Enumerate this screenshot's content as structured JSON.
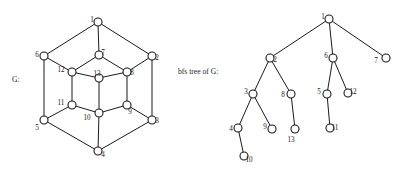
{
  "figure": {
    "width": 408,
    "height": 173,
    "background": "#ffffff",
    "stroke_color": "#1a1a1a",
    "node_fill": "#ffffff"
  },
  "captions": {
    "left_label": "G:",
    "right_label": "bfs tree of G:"
  },
  "chart_data": {
    "type": "diagram",
    "title": "",
    "subtitle": "",
    "panels": [
      {
        "name": "graph-g",
        "label": "G:",
        "label_position": {
          "x": 12,
          "y": 75
        },
        "description": "Undirected graph G drawn as three nested hexagonal rings",
        "nodes": [
          {
            "id": "1",
            "x": 98,
            "y": 22,
            "label": "1",
            "label_dx": -6,
            "label_dy": -2
          },
          {
            "id": "6",
            "x": 44,
            "y": 56,
            "label": "6",
            "label_dx": -7,
            "label_dy": -1
          },
          {
            "id": "2",
            "x": 152,
            "y": 56,
            "label": "2",
            "label_dx": 5,
            "label_dy": 2
          },
          {
            "id": "7",
            "x": 99,
            "y": 55,
            "label": "7",
            "label_dx": 4,
            "label_dy": -2
          },
          {
            "id": "12",
            "x": 72,
            "y": 72,
            "label": "12",
            "label_dx": -11,
            "label_dy": -2
          },
          {
            "id": "13",
            "x": 99,
            "y": 78,
            "label": "13",
            "label_dx": -2,
            "label_dy": -4
          },
          {
            "id": "8",
            "x": 127,
            "y": 72,
            "label": "8",
            "label_dx": 5,
            "label_dy": 1
          },
          {
            "id": "11",
            "x": 72,
            "y": 105,
            "label": "11",
            "label_dx": -11,
            "label_dy": -2
          },
          {
            "id": "9",
            "x": 127,
            "y": 105,
            "label": "9",
            "label_dx": 3,
            "label_dy": 7
          },
          {
            "id": "10",
            "x": 99,
            "y": 113,
            "label": "10",
            "label_dx": -12,
            "label_dy": 5
          },
          {
            "id": "5",
            "x": 44,
            "y": 120,
            "label": "5",
            "label_dx": -7,
            "label_dy": 8
          },
          {
            "id": "3",
            "x": 152,
            "y": 120,
            "label": "3",
            "label_dx": 5,
            "label_dy": 1
          },
          {
            "id": "4",
            "x": 98,
            "y": 151,
            "label": "4",
            "label_dx": 5,
            "label_dy": 4
          }
        ],
        "edges": [
          [
            "1",
            "6"
          ],
          [
            "1",
            "2"
          ],
          [
            "1",
            "7"
          ],
          [
            "6",
            "12"
          ],
          [
            "6",
            "5"
          ],
          [
            "2",
            "8"
          ],
          [
            "2",
            "3"
          ],
          [
            "7",
            "12"
          ],
          [
            "7",
            "8"
          ],
          [
            "12",
            "13"
          ],
          [
            "12",
            "11"
          ],
          [
            "13",
            "8"
          ],
          [
            "13",
            "10"
          ],
          [
            "8",
            "9"
          ],
          [
            "11",
            "10"
          ],
          [
            "11",
            "5"
          ],
          [
            "9",
            "10"
          ],
          [
            "9",
            "3"
          ],
          [
            "10",
            "4"
          ],
          [
            "5",
            "4"
          ],
          [
            "3",
            "4"
          ]
        ]
      },
      {
        "name": "bfs-tree-of-g",
        "label": "bfs tree of G:",
        "label_position": {
          "x": 178,
          "y": 67
        },
        "description": "Breadth-first search tree of G rooted at vertex 1",
        "nodes": [
          {
            "id": "1",
            "x": 329,
            "y": 19,
            "label": "1",
            "label_dx": -6,
            "label_dy": -2
          },
          {
            "id": "2",
            "x": 270,
            "y": 58,
            "label": "2",
            "label_dx": 5,
            "label_dy": 2
          },
          {
            "id": "6",
            "x": 333,
            "y": 58,
            "label": "6",
            "label_dx": -7,
            "label_dy": -2
          },
          {
            "id": "7",
            "x": 386,
            "y": 58,
            "label": "7",
            "label_dx": -10,
            "label_dy": 3
          },
          {
            "id": "3",
            "x": 253,
            "y": 94,
            "label": "3",
            "label_dx": -7,
            "label_dy": -2
          },
          {
            "id": "8",
            "x": 291,
            "y": 94,
            "label": "8",
            "label_dx": -8,
            "label_dy": 1
          },
          {
            "id": "5",
            "x": 327,
            "y": 94,
            "label": "5",
            "label_dx": -8,
            "label_dy": -2
          },
          {
            "id": "12",
            "x": 348,
            "y": 93,
            "label": "12",
            "label_dx": 5,
            "label_dy": -1
          },
          {
            "id": "4",
            "x": 238,
            "y": 128,
            "label": "4",
            "label_dx": -7,
            "label_dy": 1
          },
          {
            "id": "9",
            "x": 272,
            "y": 129,
            "label": "9",
            "label_dx": -7,
            "label_dy": -2
          },
          {
            "id": "13",
            "x": 295,
            "y": 129,
            "label": "13",
            "label_dx": -4,
            "label_dy": 11
          },
          {
            "id": "11",
            "x": 330,
            "y": 128,
            "label": "11",
            "label_dx": 5,
            "label_dy": 0
          },
          {
            "id": "10",
            "x": 244,
            "y": 156,
            "label": "10",
            "label_dx": 5,
            "label_dy": 4
          }
        ],
        "edges": [
          [
            "1",
            "2"
          ],
          [
            "1",
            "6"
          ],
          [
            "1",
            "7"
          ],
          [
            "2",
            "3"
          ],
          [
            "2",
            "8"
          ],
          [
            "6",
            "5"
          ],
          [
            "6",
            "12"
          ],
          [
            "3",
            "4"
          ],
          [
            "3",
            "9"
          ],
          [
            "8",
            "13"
          ],
          [
            "5",
            "11"
          ],
          [
            "4",
            "10"
          ]
        ]
      }
    ],
    "node_radius": 4,
    "legend": [],
    "grid": false
  }
}
